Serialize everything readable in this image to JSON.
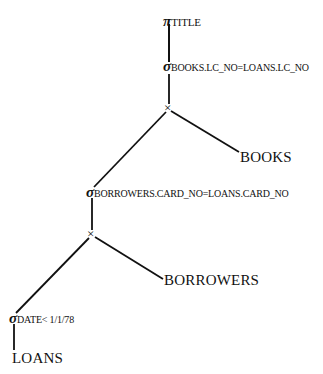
{
  "tree": {
    "project": {
      "symbol": "π",
      "attr": "TITLE"
    },
    "select1": {
      "symbol": "σ",
      "cond": "BOOKS.LC_NO=LOANS.LC_NO"
    },
    "product1": {
      "symbol": "×"
    },
    "books": "BOOKS",
    "select2": {
      "symbol": "σ",
      "cond": "BORROWERS.CARD_NO=LOANS.CARD_NO"
    },
    "product2": {
      "symbol": "×"
    },
    "borrowers": "BORROWERS",
    "select3": {
      "symbol": "σ",
      "cond": "DATE< 1/1/78"
    },
    "loans": "LOANS"
  }
}
